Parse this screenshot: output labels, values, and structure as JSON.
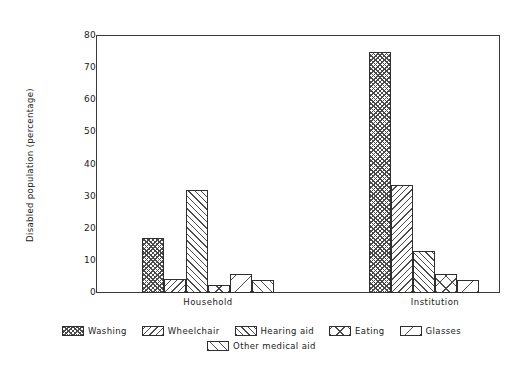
{
  "chart_data": {
    "type": "bar",
    "title": "",
    "xlabel": "",
    "ylabel": "Disabled population (percentage)",
    "categories": [
      "Household",
      "Institution"
    ],
    "ylim": [
      0,
      80
    ],
    "yticks": [
      0,
      10,
      20,
      30,
      40,
      50,
      60,
      70,
      80
    ],
    "ytick_labels": [
      "0",
      "10",
      "20",
      "30",
      "40",
      "50",
      "60",
      "70",
      "80"
    ],
    "grid": false,
    "legend_position": "bottom",
    "series": [
      {
        "name": "Washing",
        "pattern": "crosshatch-fine",
        "values": [
          17,
          75
        ]
      },
      {
        "name": "Wheelchair",
        "pattern": "diagonal-back",
        "values": [
          4.5,
          33.5
        ]
      },
      {
        "name": "Hearing aid",
        "pattern": "diagonal-forward",
        "values": [
          32,
          13
        ]
      },
      {
        "name": "Eating",
        "pattern": "crosshatch-coarse",
        "values": [
          2.5,
          6
        ]
      },
      {
        "name": "Glasses",
        "pattern": "diagonal-sparse",
        "values": [
          6,
          4
        ]
      },
      {
        "name": "Other medical aid",
        "pattern": "diagonal-medium",
        "values": [
          4,
          0
        ]
      }
    ]
  },
  "legend": {
    "row1": [
      "Washing",
      "Wheelchair",
      "Hearing aid",
      "Eating",
      "Glasses"
    ],
    "row2": [
      "Other medical aid"
    ]
  },
  "colors": {
    "axis": "#3a3a3a",
    "hatch": "#4a4a4a",
    "bar_border": "#2f2f2f",
    "background": "#ffffff",
    "text": "#1a1a1a"
  }
}
